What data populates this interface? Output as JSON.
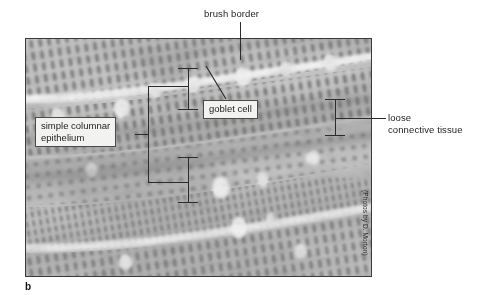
{
  "figure": {
    "part_letter": "b",
    "photo_credit": "(Photos by D. Morton)"
  },
  "labels": {
    "brush_border": "brush border",
    "goblet_cell": "goblet cell",
    "simple_columnar_epithelium_line1": "simple columnar",
    "simple_columnar_epithelium_line2": "epithelium",
    "loose_connective_tissue_line1": "loose",
    "loose_connective_tissue_line2": "connective tissue"
  },
  "colors": {
    "line": "#2b2b2b",
    "label_box_fill": "#f2f2f0",
    "label_box_border": "#4a4a4a",
    "text": "#1d1d1d",
    "photo_border": "#3a3a3a",
    "page_background": "#ffffff",
    "tissue_light": "#e8e8e8",
    "tissue_mid": "#b5b5b5",
    "tissue_dark": "#6f6f6f"
  }
}
